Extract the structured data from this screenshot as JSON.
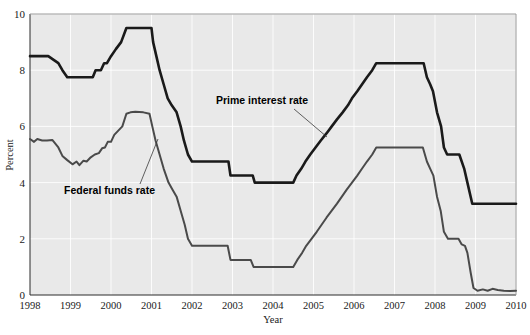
{
  "chart_data": {
    "type": "line",
    "title": "",
    "xlabel": "Year",
    "ylabel": "Percent",
    "xlim": [
      1998,
      2010
    ],
    "ylim": [
      0,
      10
    ],
    "grid": true,
    "legend_position": "inline-annotation",
    "xticks": [
      "1998",
      "1999",
      "2000",
      "2001",
      "2002",
      "2003",
      "2004",
      "2005",
      "2006",
      "2007",
      "2008",
      "2009",
      "2010"
    ],
    "yticks": [
      "0",
      "2",
      "4",
      "6",
      "8",
      "10"
    ],
    "series": [
      {
        "name": "Prime interest rate",
        "color": "#1a1a1a",
        "width": 2.6,
        "points": [
          [
            1998.0,
            8.5
          ],
          [
            1998.45,
            8.5
          ],
          [
            1998.7,
            8.25
          ],
          [
            1998.8,
            8.0
          ],
          [
            1998.92,
            7.75
          ],
          [
            1999.55,
            7.75
          ],
          [
            1999.62,
            8.0
          ],
          [
            1999.75,
            8.0
          ],
          [
            1999.83,
            8.25
          ],
          [
            1999.9,
            8.25
          ],
          [
            2000.0,
            8.5
          ],
          [
            2000.12,
            8.75
          ],
          [
            2000.25,
            9.0
          ],
          [
            2000.38,
            9.5
          ],
          [
            2000.52,
            9.5
          ],
          [
            2001.0,
            9.5
          ],
          [
            2001.04,
            9.0
          ],
          [
            2001.12,
            8.5
          ],
          [
            2001.2,
            8.0
          ],
          [
            2001.3,
            7.5
          ],
          [
            2001.4,
            7.0
          ],
          [
            2001.5,
            6.75
          ],
          [
            2001.62,
            6.5
          ],
          [
            2001.72,
            6.0
          ],
          [
            2001.8,
            5.5
          ],
          [
            2001.9,
            5.0
          ],
          [
            2002.0,
            4.75
          ],
          [
            2002.9,
            4.75
          ],
          [
            2002.95,
            4.25
          ],
          [
            2003.5,
            4.25
          ],
          [
            2003.55,
            4.0
          ],
          [
            2004.5,
            4.0
          ],
          [
            2004.58,
            4.25
          ],
          [
            2004.7,
            4.5
          ],
          [
            2004.8,
            4.75
          ],
          [
            2004.92,
            5.0
          ],
          [
            2005.05,
            5.25
          ],
          [
            2005.18,
            5.5
          ],
          [
            2005.32,
            5.75
          ],
          [
            2005.45,
            6.0
          ],
          [
            2005.58,
            6.25
          ],
          [
            2005.72,
            6.5
          ],
          [
            2005.85,
            6.75
          ],
          [
            2005.95,
            7.0
          ],
          [
            2006.08,
            7.25
          ],
          [
            2006.2,
            7.5
          ],
          [
            2006.32,
            7.75
          ],
          [
            2006.45,
            8.0
          ],
          [
            2006.55,
            8.25
          ],
          [
            2007.72,
            8.25
          ],
          [
            2007.8,
            7.75
          ],
          [
            2007.88,
            7.5
          ],
          [
            2007.95,
            7.25
          ],
          [
            2008.05,
            6.5
          ],
          [
            2008.15,
            6.0
          ],
          [
            2008.22,
            5.25
          ],
          [
            2008.3,
            5.0
          ],
          [
            2008.6,
            5.0
          ],
          [
            2008.72,
            4.5
          ],
          [
            2008.8,
            4.0
          ],
          [
            2008.92,
            3.25
          ],
          [
            2010.0,
            3.25
          ]
        ]
      },
      {
        "name": "Federal funds rate",
        "color": "#4a4a4a",
        "width": 2.0,
        "points": [
          [
            1998.0,
            5.55
          ],
          [
            1998.1,
            5.45
          ],
          [
            1998.18,
            5.55
          ],
          [
            1998.3,
            5.5
          ],
          [
            1998.42,
            5.5
          ],
          [
            1998.55,
            5.52
          ],
          [
            1998.7,
            5.25
          ],
          [
            1998.8,
            4.95
          ],
          [
            1998.92,
            4.8
          ],
          [
            1999.05,
            4.65
          ],
          [
            1999.15,
            4.75
          ],
          [
            1999.22,
            4.62
          ],
          [
            1999.32,
            4.78
          ],
          [
            1999.4,
            4.75
          ],
          [
            1999.5,
            4.9
          ],
          [
            1999.6,
            5.0
          ],
          [
            1999.7,
            5.05
          ],
          [
            1999.78,
            5.22
          ],
          [
            1999.85,
            5.25
          ],
          [
            1999.92,
            5.45
          ],
          [
            2000.0,
            5.45
          ],
          [
            2000.08,
            5.7
          ],
          [
            2000.18,
            5.85
          ],
          [
            2000.28,
            6.0
          ],
          [
            2000.38,
            6.45
          ],
          [
            2000.48,
            6.5
          ],
          [
            2000.6,
            6.52
          ],
          [
            2000.8,
            6.5
          ],
          [
            2000.95,
            6.45
          ],
          [
            2001.02,
            6.0
          ],
          [
            2001.1,
            5.5
          ],
          [
            2001.2,
            5.0
          ],
          [
            2001.3,
            4.5
          ],
          [
            2001.42,
            4.0
          ],
          [
            2001.52,
            3.75
          ],
          [
            2001.62,
            3.5
          ],
          [
            2001.72,
            3.0
          ],
          [
            2001.82,
            2.5
          ],
          [
            2001.9,
            2.0
          ],
          [
            2002.0,
            1.75
          ],
          [
            2002.88,
            1.75
          ],
          [
            2002.95,
            1.25
          ],
          [
            2003.45,
            1.25
          ],
          [
            2003.52,
            1.0
          ],
          [
            2004.5,
            1.0
          ],
          [
            2004.6,
            1.25
          ],
          [
            2004.72,
            1.5
          ],
          [
            2004.82,
            1.75
          ],
          [
            2004.95,
            2.0
          ],
          [
            2005.08,
            2.25
          ],
          [
            2005.2,
            2.5
          ],
          [
            2005.32,
            2.75
          ],
          [
            2005.45,
            3.0
          ],
          [
            2005.58,
            3.25
          ],
          [
            2005.7,
            3.5
          ],
          [
            2005.82,
            3.75
          ],
          [
            2005.95,
            4.0
          ],
          [
            2006.08,
            4.25
          ],
          [
            2006.2,
            4.5
          ],
          [
            2006.32,
            4.75
          ],
          [
            2006.45,
            5.0
          ],
          [
            2006.55,
            5.25
          ],
          [
            2007.7,
            5.25
          ],
          [
            2007.8,
            4.75
          ],
          [
            2007.88,
            4.5
          ],
          [
            2007.96,
            4.25
          ],
          [
            2008.05,
            3.5
          ],
          [
            2008.14,
            3.0
          ],
          [
            2008.22,
            2.25
          ],
          [
            2008.32,
            2.0
          ],
          [
            2008.58,
            2.0
          ],
          [
            2008.66,
            1.8
          ],
          [
            2008.74,
            1.75
          ],
          [
            2008.8,
            1.5
          ],
          [
            2008.88,
            0.8
          ],
          [
            2008.95,
            0.25
          ],
          [
            2009.05,
            0.15
          ],
          [
            2009.18,
            0.2
          ],
          [
            2009.3,
            0.15
          ],
          [
            2009.42,
            0.22
          ],
          [
            2009.55,
            0.18
          ],
          [
            2009.7,
            0.15
          ],
          [
            2009.85,
            0.14
          ],
          [
            2010.0,
            0.15
          ]
        ]
      }
    ],
    "annotations": [
      {
        "name": "prime-interest-rate-annotation",
        "text": "Prime interest rate",
        "text_x": 216,
        "text_y": 104,
        "leader": [
          [
            294,
            109
          ],
          [
            327,
            137
          ]
        ]
      },
      {
        "name": "federal-funds-rate-annotation",
        "text": "Federal funds rate",
        "text_x": 64,
        "text_y": 194,
        "leader": [
          [
            140,
            184
          ],
          [
            158,
            139
          ]
        ]
      }
    ]
  }
}
